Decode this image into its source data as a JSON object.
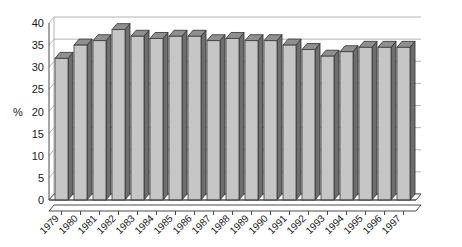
{
  "chart_data": {
    "type": "bar",
    "title": "",
    "xlabel": "",
    "ylabel": "%",
    "ylim": [
      0,
      40
    ],
    "ytick_step": 5,
    "yticks": [
      "0",
      "5",
      "10",
      "15",
      "20",
      "25",
      "30",
      "35",
      "40"
    ],
    "grid": true,
    "legend": "none",
    "style": "3d-column",
    "categories": [
      "1979",
      "1980",
      "1981",
      "1982",
      "1983",
      "1984",
      "1985",
      "1986",
      "1987",
      "1988",
      "1989",
      "1990",
      "1991",
      "1992",
      "1993",
      "1994",
      "1995",
      "1996",
      "1997"
    ],
    "values": [
      32,
      35,
      36,
      38.5,
      37,
      36.5,
      37,
      37,
      36,
      36.5,
      36,
      36,
      35,
      34,
      32.5,
      33.5,
      34.5,
      34.5,
      34.5
    ],
    "series": [
      {
        "name": "",
        "values": [
          32,
          35,
          36,
          38.5,
          37,
          36.5,
          37,
          37,
          36,
          36.5,
          36,
          36,
          35,
          34,
          32.5,
          33.5,
          34.5,
          34.5,
          34.5
        ]
      }
    ]
  },
  "axis": {
    "y_axis_label": "%",
    "y_tick_labels": [
      "40",
      "35",
      "30",
      "25",
      "20",
      "15",
      "10",
      "5",
      "0"
    ],
    "x_tick_labels": [
      "1979",
      "1980",
      "1981",
      "1982",
      "1983",
      "1984",
      "1985",
      "1986",
      "1987",
      "1988",
      "1989",
      "1990",
      "1991",
      "1992",
      "1993",
      "1994",
      "1995",
      "1996",
      "1997"
    ]
  },
  "colors": {
    "bar_front": "#c6c6c6",
    "bar_side": "#6e6e6e",
    "bar_top": "#8f8f8f",
    "gridline": "#b4b4b4",
    "axis": "#4a4a4a",
    "background": "#ffffff",
    "text": "#1a1a1a"
  }
}
